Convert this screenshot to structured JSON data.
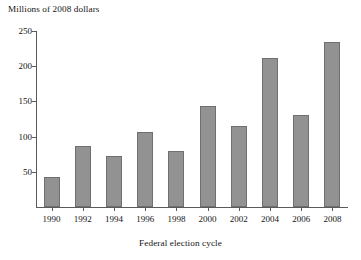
{
  "chart_data": {
    "type": "bar",
    "title": "",
    "xlabel": "Federal election cycle",
    "ylabel": "Millions of 2008 dollars",
    "categories": [
      "1990",
      "1992",
      "1994",
      "1996",
      "1998",
      "2000",
      "2002",
      "2004",
      "2006",
      "2008"
    ],
    "values": [
      42,
      87,
      72,
      107,
      80,
      143,
      115,
      211,
      130,
      235
    ],
    "ylim": [
      0,
      250
    ],
    "yticks": [
      50,
      100,
      150,
      200,
      250
    ],
    "ytick_labels": [
      "50",
      "100",
      "150",
      "200",
      "250"
    ],
    "grid": false,
    "legend": null,
    "series": [
      {
        "name": "Federal election cycle spending",
        "values": [
          42,
          87,
          72,
          107,
          80,
          143,
          115,
          211,
          130,
          235
        ]
      }
    ],
    "bar_color": "#929292",
    "bar_edge_color": "#6f6f6f",
    "axis_color": "#5a5a5a",
    "background_color": "#ffffff"
  },
  "axes": {
    "y_title": "Millions of 2008 dollars",
    "x_title": "Federal election cycle"
  }
}
